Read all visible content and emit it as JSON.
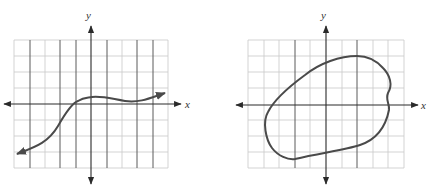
{
  "graphs": [
    {
      "id": "left",
      "axis_labels": {
        "x": "x",
        "y": "y"
      },
      "description": "Function curve with arrowheads at both ends, rising S-shape then leveling",
      "grid": {
        "columns": 10,
        "rows": 8
      }
    },
    {
      "id": "right",
      "axis_labels": {
        "x": "x",
        "y": "y"
      },
      "description": "Closed loop curve",
      "grid": {
        "columns": 10,
        "rows": 8
      }
    }
  ],
  "colors": {
    "curve": "#4a4a4a",
    "axis": "#2a2a2a",
    "grid_light": "#c8c8c8",
    "grid_dark": "#5a5a5a"
  }
}
